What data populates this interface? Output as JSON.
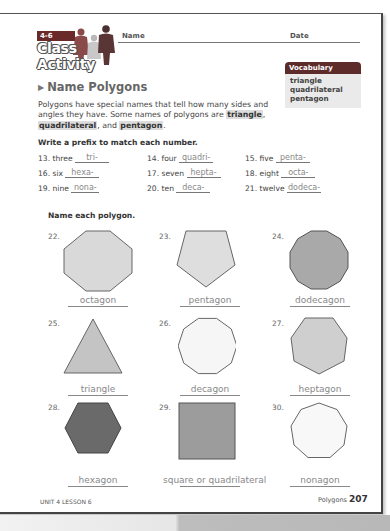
{
  "header": {
    "lesson_tag": "4-6",
    "logo_title": "Class Activity",
    "name_label": "Name",
    "date_label": "Date"
  },
  "vocabulary": {
    "title": "Vocabulary",
    "words": [
      "triangle",
      "quadrilateral",
      "pentagon"
    ]
  },
  "section": {
    "title": "Name Polygons",
    "intro_1": "Polygons have special names that tell how many sides and angles they have. Some names of polygons are ",
    "term_1": "triangle",
    "sep_1": ",",
    "term_2": "quadrilateral",
    "sep_2": ", and ",
    "term_3": "pentagon",
    "end": "."
  },
  "prefix_exercise": {
    "instruction": "Write a prefix to match each number.",
    "items": [
      {
        "label": "13. three",
        "answer": "tri-"
      },
      {
        "label": "14. four",
        "answer": "quadri-"
      },
      {
        "label": "15. five",
        "answer": "penta-"
      },
      {
        "label": "16. six",
        "answer": "hexa-"
      },
      {
        "label": "17. seven",
        "answer": "hepta-"
      },
      {
        "label": "18. eight",
        "answer": "octa-"
      },
      {
        "label": "19. nine",
        "answer": "nona-"
      },
      {
        "label": "20. ten",
        "answer": "deca-"
      },
      {
        "label": "21. twelve",
        "answer": "dodeca-"
      }
    ]
  },
  "polygon_exercise": {
    "instruction": "Name each polygon.",
    "items": [
      {
        "number": "22.",
        "answer": "octagon",
        "sides": 8,
        "fill": "#d9d9d9"
      },
      {
        "number": "23.",
        "answer": "pentagon",
        "sides": 5,
        "fill": "#dedede"
      },
      {
        "number": "24.",
        "answer": "dodecagon",
        "sides": 12,
        "fill": "#a9a9a9"
      },
      {
        "number": "25.",
        "answer": "triangle",
        "sides": 3,
        "fill": "#c4c4c4"
      },
      {
        "number": "26.",
        "answer": "decagon",
        "sides": 10,
        "fill": "#f6f6f6"
      },
      {
        "number": "27.",
        "answer": "heptagon",
        "sides": 7,
        "fill": "#cfcfcf"
      },
      {
        "number": "28.",
        "answer": "hexagon",
        "sides": 6,
        "fill": "#6a6a6a"
      },
      {
        "number": "29.",
        "answer": "square or quadrilateral",
        "sides": 4,
        "fill": "#9c9c9c"
      },
      {
        "number": "30.",
        "answer": "nonagon",
        "sides": 9,
        "fill": "#f8f8f8"
      }
    ]
  },
  "footer": {
    "unit": "UNIT 4 LESSON 6",
    "topic": "Polygons",
    "page": "207"
  }
}
